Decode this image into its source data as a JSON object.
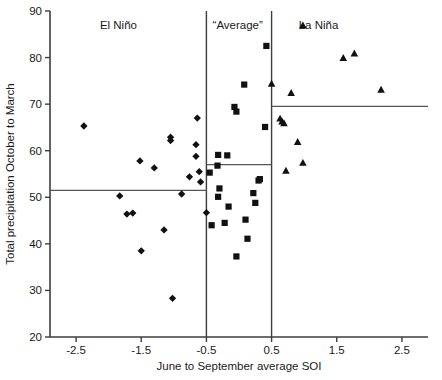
{
  "chart_data": {
    "type": "scatter",
    "title": "",
    "xlabel": "June to September average SOI",
    "ylabel": "Total precipitation October to March",
    "xlim": [
      -2.9,
      2.9
    ],
    "ylim": [
      20,
      90
    ],
    "xticks": [
      -2.5,
      -1.5,
      -0.5,
      0.5,
      1.5,
      2.5
    ],
    "xticklabels": [
      "-2.5",
      "-1.5",
      "-0.5",
      "0.5",
      "1.5",
      "2.5"
    ],
    "yticks": [
      20,
      30,
      40,
      50,
      60,
      70,
      80,
      90
    ],
    "yticklabels": [
      "20",
      "30",
      "40",
      "50",
      "60",
      "70",
      "80",
      "90"
    ],
    "grid": false,
    "legend_position": "top-right",
    "panel_labels": [
      {
        "text": "El Niño",
        "x": -1.85,
        "y": 87.0
      },
      {
        "text": "“Average”",
        "x": -0.02,
        "y": 87.0
      },
      {
        "text": "La Niña",
        "x": 1.22,
        "y": 87.0
      }
    ],
    "legend": [
      {
        "name": "La Niña",
        "marker": "triangle",
        "x": 0.98,
        "y": 87.0
      }
    ],
    "dividers": [
      {
        "orientation": "vertical",
        "value": -0.5
      },
      {
        "orientation": "vertical",
        "value": 0.5
      }
    ],
    "mean_lines": [
      {
        "label": "El Niño mean",
        "y": 51.5,
        "x_from": -2.9,
        "x_to": -0.5
      },
      {
        "label": "Average mean",
        "y": 57.0,
        "x_from": -0.5,
        "x_to": 0.5
      },
      {
        "label": "La Niña mean",
        "y": 69.5,
        "x_from": 0.5,
        "x_to": 2.9
      }
    ],
    "series": [
      {
        "name": "El Niño",
        "marker": "diamond",
        "color": "#111111",
        "points": [
          [
            -2.38,
            65.3
          ],
          [
            -1.83,
            50.3
          ],
          [
            -1.72,
            46.4
          ],
          [
            -1.63,
            46.6
          ],
          [
            -1.52,
            57.8
          ],
          [
            -1.5,
            38.5
          ],
          [
            -1.3,
            56.3
          ],
          [
            -1.15,
            43.0
          ],
          [
            -1.05,
            62.9
          ],
          [
            -1.05,
            62.2
          ],
          [
            -1.02,
            28.3
          ],
          [
            -0.88,
            50.7
          ],
          [
            -0.76,
            54.4
          ],
          [
            -0.66,
            61.3
          ],
          [
            -0.66,
            58.8
          ],
          [
            -0.64,
            67.0
          ],
          [
            -0.61,
            55.5
          ],
          [
            -0.59,
            53.3
          ],
          [
            -0.5,
            46.7
          ]
        ]
      },
      {
        "name": "Average",
        "marker": "square",
        "color": "#111111",
        "points": [
          [
            -0.45,
            55.3
          ],
          [
            -0.42,
            44.0
          ],
          [
            -0.33,
            56.8
          ],
          [
            -0.32,
            59.1
          ],
          [
            -0.32,
            50.1
          ],
          [
            -0.3,
            51.9
          ],
          [
            -0.22,
            44.5
          ],
          [
            -0.18,
            59.0
          ],
          [
            -0.16,
            48.0
          ],
          [
            -0.07,
            69.4
          ],
          [
            -0.04,
            68.4
          ],
          [
            -0.04,
            37.3
          ],
          [
            0.08,
            74.2
          ],
          [
            0.1,
            45.2
          ],
          [
            0.13,
            41.1
          ],
          [
            0.22,
            50.9
          ],
          [
            0.25,
            48.8
          ],
          [
            0.3,
            53.6
          ],
          [
            0.32,
            53.9
          ],
          [
            0.4,
            65.1
          ],
          [
            0.42,
            82.5
          ]
        ]
      },
      {
        "name": "La Niña",
        "marker": "triangle",
        "color": "#111111",
        "points": [
          [
            0.5,
            74.5
          ],
          [
            0.63,
            67.0
          ],
          [
            0.66,
            66.4
          ],
          [
            0.69,
            66.0
          ],
          [
            0.72,
            55.8
          ],
          [
            0.8,
            72.5
          ],
          [
            0.9,
            62.0
          ],
          [
            0.98,
            57.5
          ],
          [
            1.6,
            80.0
          ],
          [
            1.77,
            81.0
          ],
          [
            2.18,
            73.2
          ]
        ]
      }
    ]
  }
}
